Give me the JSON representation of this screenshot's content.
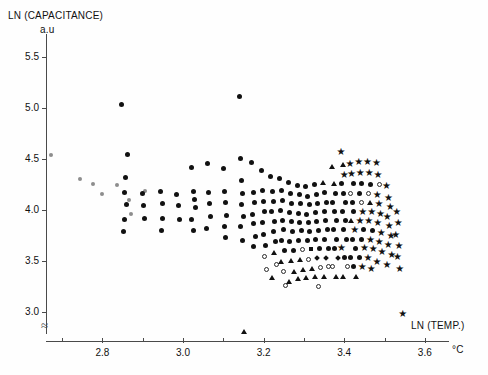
{
  "chart_data": {
    "type": "scatter",
    "title": "",
    "ylabel": "LN (CAPACITANCE)",
    "ylabel_unit": "a.u",
    "xlabel": "LN (TEMP.)",
    "xlabel_unit": "°C",
    "xlim": [
      2.66,
      3.66
    ],
    "ylim": [
      2.72,
      5.72
    ],
    "xticks": [
      2.8,
      3.0,
      3.2,
      3.4,
      3.6
    ],
    "xtick_labels": [
      "2.8",
      "3.0",
      "3.2",
      "3.4",
      "3.6"
    ],
    "xminor_ticks": [
      2.7,
      2.9,
      3.1,
      3.3,
      3.5
    ],
    "yticks": [
      3.0,
      3.5,
      4.0,
      4.5,
      5.0,
      5.5
    ],
    "ytick_labels": [
      "3.0",
      "3.5",
      "4.0",
      "4.5",
      "5.0",
      "5.5"
    ],
    "grid": false,
    "legend": "none",
    "axis_break_y": true,
    "marker_kinds": [
      "circle",
      "open-circle",
      "triangle",
      "star",
      "square",
      "diamond",
      "faint-circle"
    ],
    "n_points": 386,
    "points": [
      [
        2.673,
        4.535,
        "faint"
      ],
      [
        2.745,
        4.3,
        "faint"
      ],
      [
        2.8,
        4.16,
        "faint"
      ],
      [
        2.836,
        4.245,
        "faint"
      ],
      [
        2.866,
        4.095,
        "faint"
      ],
      [
        2.87,
        3.96,
        "faint"
      ],
      [
        2.905,
        4.185,
        "faint"
      ],
      [
        2.776,
        4.255,
        "faint"
      ],
      [
        2.847,
        5.035,
        "circle"
      ],
      [
        2.862,
        4.545,
        "circle"
      ],
      [
        2.858,
        4.32,
        "circle"
      ],
      [
        2.855,
        4.175,
        "circle"
      ],
      [
        2.86,
        4.055,
        "circle"
      ],
      [
        2.856,
        3.905,
        "circle"
      ],
      [
        2.853,
        3.79,
        "circle"
      ],
      [
        2.9,
        4.165,
        "circle"
      ],
      [
        2.902,
        4.04,
        "circle"
      ],
      [
        2.905,
        3.915,
        "circle"
      ],
      [
        2.945,
        4.185,
        "circle"
      ],
      [
        2.948,
        4.06,
        "circle"
      ],
      [
        2.95,
        3.915,
        "circle"
      ],
      [
        2.946,
        3.8,
        "circle"
      ],
      [
        2.985,
        4.15,
        "circle"
      ],
      [
        2.99,
        4.045,
        "circle"
      ],
      [
        2.992,
        3.905,
        "circle"
      ],
      [
        3.02,
        4.42,
        "circle"
      ],
      [
        3.025,
        4.185,
        "circle"
      ],
      [
        3.028,
        4.105,
        "circle"
      ],
      [
        3.03,
        4.025,
        "circle"
      ],
      [
        3.022,
        3.905,
        "circle"
      ],
      [
        3.026,
        3.8,
        "circle"
      ],
      [
        3.06,
        4.455,
        "circle"
      ],
      [
        3.062,
        4.17,
        "circle"
      ],
      [
        3.065,
        4.06,
        "circle"
      ],
      [
        3.068,
        3.935,
        "circle"
      ],
      [
        3.058,
        3.815,
        "circle"
      ],
      [
        3.1,
        4.405,
        "circle"
      ],
      [
        3.104,
        4.18,
        "circle"
      ],
      [
        3.106,
        4.075,
        "circle"
      ],
      [
        3.108,
        3.95,
        "circle"
      ],
      [
        3.102,
        3.835,
        "circle"
      ],
      [
        3.105,
        3.735,
        "circle"
      ],
      [
        3.14,
        5.105,
        "circle"
      ],
      [
        3.142,
        4.5,
        "circle"
      ],
      [
        3.146,
        4.29,
        "circle"
      ],
      [
        3.148,
        4.16,
        "circle"
      ],
      [
        3.144,
        4.055,
        "circle"
      ],
      [
        3.15,
        3.94,
        "circle"
      ],
      [
        3.143,
        3.84,
        "circle"
      ],
      [
        3.147,
        3.7,
        "circle"
      ],
      [
        3.152,
        2.81,
        "triangle"
      ],
      [
        3.17,
        4.46,
        "circle"
      ],
      [
        3.175,
        4.175,
        "circle"
      ],
      [
        3.178,
        4.07,
        "circle"
      ],
      [
        3.172,
        3.96,
        "circle"
      ],
      [
        3.176,
        3.87,
        "circle"
      ],
      [
        3.18,
        3.745,
        "circle"
      ],
      [
        3.174,
        3.64,
        "circle"
      ],
      [
        3.195,
        4.385,
        "circle"
      ],
      [
        3.198,
        4.195,
        "circle"
      ],
      [
        3.2,
        4.08,
        "circle"
      ],
      [
        3.202,
        3.985,
        "circle"
      ],
      [
        3.196,
        3.88,
        "circle"
      ],
      [
        3.199,
        3.76,
        "circle"
      ],
      [
        3.204,
        3.655,
        "circle"
      ],
      [
        3.201,
        3.545,
        "open"
      ],
      [
        3.206,
        3.42,
        "open"
      ],
      [
        3.218,
        4.33,
        "circle"
      ],
      [
        3.222,
        4.18,
        "circle"
      ],
      [
        3.225,
        4.085,
        "circle"
      ],
      [
        3.22,
        3.99,
        "circle"
      ],
      [
        3.228,
        3.89,
        "circle"
      ],
      [
        3.224,
        3.79,
        "circle"
      ],
      [
        3.23,
        3.69,
        "circle"
      ],
      [
        3.226,
        3.58,
        "triangle"
      ],
      [
        3.232,
        3.47,
        "open"
      ],
      [
        3.221,
        3.345,
        "triangle"
      ],
      [
        3.24,
        4.31,
        "circle"
      ],
      [
        3.244,
        4.195,
        "circle"
      ],
      [
        3.248,
        4.09,
        "circle"
      ],
      [
        3.242,
        3.995,
        "circle"
      ],
      [
        3.246,
        3.9,
        "circle"
      ],
      [
        3.25,
        3.805,
        "circle"
      ],
      [
        3.245,
        3.705,
        "circle"
      ],
      [
        3.252,
        3.6,
        "circle"
      ],
      [
        3.243,
        3.5,
        "triangle"
      ],
      [
        3.249,
        3.395,
        "open"
      ],
      [
        3.254,
        3.265,
        "open"
      ],
      [
        3.262,
        4.265,
        "circle"
      ],
      [
        3.266,
        4.16,
        "circle"
      ],
      [
        3.27,
        4.065,
        "circle"
      ],
      [
        3.264,
        3.975,
        "circle"
      ],
      [
        3.268,
        3.885,
        "circle"
      ],
      [
        3.272,
        3.79,
        "circle"
      ],
      [
        3.265,
        3.695,
        "circle"
      ],
      [
        3.274,
        3.605,
        "circle"
      ],
      [
        3.269,
        3.505,
        "triangle"
      ],
      [
        3.276,
        3.4,
        "triangle"
      ],
      [
        3.263,
        3.3,
        "triangle"
      ],
      [
        3.284,
        4.24,
        "circle"
      ],
      [
        3.288,
        4.15,
        "circle"
      ],
      [
        3.292,
        4.06,
        "circle"
      ],
      [
        3.286,
        3.97,
        "circle"
      ],
      [
        3.29,
        3.88,
        "circle"
      ],
      [
        3.294,
        3.795,
        "circle"
      ],
      [
        3.287,
        3.7,
        "circle"
      ],
      [
        3.296,
        3.61,
        "open"
      ],
      [
        3.291,
        3.515,
        "triangle"
      ],
      [
        3.298,
        3.42,
        "triangle"
      ],
      [
        3.285,
        3.33,
        "triangle"
      ],
      [
        3.305,
        4.225,
        "circle"
      ],
      [
        3.309,
        4.135,
        "circle"
      ],
      [
        3.313,
        4.05,
        "circle"
      ],
      [
        3.307,
        3.96,
        "circle"
      ],
      [
        3.311,
        3.875,
        "circle"
      ],
      [
        3.315,
        3.79,
        "circle"
      ],
      [
        3.308,
        3.7,
        "circle"
      ],
      [
        3.317,
        3.615,
        "square"
      ],
      [
        3.312,
        3.52,
        "open"
      ],
      [
        3.319,
        3.43,
        "triangle"
      ],
      [
        3.306,
        3.34,
        "triangle"
      ],
      [
        3.326,
        4.245,
        "circle"
      ],
      [
        3.33,
        4.15,
        "circle"
      ],
      [
        3.334,
        4.06,
        "circle"
      ],
      [
        3.328,
        3.975,
        "circle"
      ],
      [
        3.332,
        3.885,
        "circle"
      ],
      [
        3.336,
        3.8,
        "circle"
      ],
      [
        3.329,
        3.71,
        "circle"
      ],
      [
        3.338,
        3.62,
        "circle"
      ],
      [
        3.333,
        3.53,
        "diamond"
      ],
      [
        3.34,
        3.44,
        "open"
      ],
      [
        3.327,
        3.35,
        "triangle"
      ],
      [
        3.335,
        3.255,
        "open"
      ],
      [
        3.348,
        4.27,
        "triangle"
      ],
      [
        3.352,
        4.17,
        "circle"
      ],
      [
        3.356,
        4.075,
        "circle"
      ],
      [
        3.35,
        3.985,
        "circle"
      ],
      [
        3.354,
        3.895,
        "circle"
      ],
      [
        3.358,
        3.805,
        "circle"
      ],
      [
        3.351,
        3.715,
        "circle"
      ],
      [
        3.36,
        3.625,
        "circle"
      ],
      [
        3.355,
        3.535,
        "diamond"
      ],
      [
        3.362,
        3.445,
        "open"
      ],
      [
        3.349,
        3.355,
        "triangle"
      ],
      [
        3.37,
        4.43,
        "triangle"
      ],
      [
        3.374,
        4.26,
        "triangle"
      ],
      [
        3.378,
        4.165,
        "circle"
      ],
      [
        3.372,
        4.075,
        "circle"
      ],
      [
        3.376,
        3.985,
        "circle"
      ],
      [
        3.38,
        3.895,
        "circle"
      ],
      [
        3.373,
        3.805,
        "circle"
      ],
      [
        3.382,
        3.715,
        "circle"
      ],
      [
        3.377,
        3.625,
        "circle"
      ],
      [
        3.384,
        3.535,
        "diamond"
      ],
      [
        3.371,
        3.445,
        "open"
      ],
      [
        3.379,
        3.355,
        "triangle"
      ],
      [
        3.392,
        4.57,
        "star"
      ],
      [
        3.396,
        4.445,
        "triangle"
      ],
      [
        3.4,
        4.345,
        "star"
      ],
      [
        3.394,
        4.255,
        "circle"
      ],
      [
        3.398,
        4.165,
        "circle"
      ],
      [
        3.402,
        4.075,
        "circle"
      ],
      [
        3.395,
        3.985,
        "circle"
      ],
      [
        3.404,
        3.895,
        "circle"
      ],
      [
        3.399,
        3.805,
        "circle"
      ],
      [
        3.406,
        3.715,
        "circle"
      ],
      [
        3.393,
        3.625,
        "star"
      ],
      [
        3.401,
        3.535,
        "circle"
      ],
      [
        3.408,
        3.445,
        "open"
      ],
      [
        3.397,
        3.355,
        "triangle"
      ],
      [
        3.414,
        4.445,
        "star"
      ],
      [
        3.418,
        4.35,
        "star"
      ],
      [
        3.422,
        4.255,
        "circle"
      ],
      [
        3.416,
        4.165,
        "open"
      ],
      [
        3.42,
        4.075,
        "circle"
      ],
      [
        3.424,
        3.985,
        "circle"
      ],
      [
        3.417,
        3.895,
        "triangle"
      ],
      [
        3.426,
        3.805,
        "star"
      ],
      [
        3.421,
        3.715,
        "circle"
      ],
      [
        3.428,
        3.625,
        "circle"
      ],
      [
        3.415,
        3.535,
        "circle"
      ],
      [
        3.423,
        3.445,
        "circle"
      ],
      [
        3.429,
        3.355,
        "triangle"
      ],
      [
        3.436,
        4.47,
        "star"
      ],
      [
        3.44,
        4.36,
        "star"
      ],
      [
        3.444,
        4.255,
        "circle"
      ],
      [
        3.438,
        4.165,
        "circle"
      ],
      [
        3.442,
        4.075,
        "open"
      ],
      [
        3.446,
        3.985,
        "star"
      ],
      [
        3.439,
        3.895,
        "star"
      ],
      [
        3.448,
        3.805,
        "circle"
      ],
      [
        3.443,
        3.715,
        "circle"
      ],
      [
        3.45,
        3.625,
        "star"
      ],
      [
        3.437,
        3.535,
        "circle"
      ],
      [
        3.445,
        3.445,
        "star"
      ],
      [
        3.458,
        4.47,
        "star"
      ],
      [
        3.462,
        4.36,
        "star"
      ],
      [
        3.466,
        4.25,
        "circle"
      ],
      [
        3.46,
        4.16,
        "open"
      ],
      [
        3.464,
        4.07,
        "triangle"
      ],
      [
        3.468,
        3.98,
        "star"
      ],
      [
        3.461,
        3.89,
        "star"
      ],
      [
        3.47,
        3.8,
        "circle"
      ],
      [
        3.465,
        3.71,
        "star"
      ],
      [
        3.472,
        3.62,
        "star"
      ],
      [
        3.459,
        3.53,
        "star"
      ],
      [
        3.467,
        3.42,
        "star"
      ],
      [
        3.48,
        4.455,
        "star"
      ],
      [
        3.484,
        4.345,
        "star"
      ],
      [
        3.488,
        4.25,
        "open"
      ],
      [
        3.482,
        4.15,
        "star"
      ],
      [
        3.486,
        4.055,
        "star"
      ],
      [
        3.49,
        3.965,
        "star"
      ],
      [
        3.483,
        3.87,
        "star"
      ],
      [
        3.492,
        3.775,
        "star"
      ],
      [
        3.487,
        3.685,
        "star"
      ],
      [
        3.494,
        3.59,
        "star"
      ],
      [
        3.481,
        3.49,
        "star"
      ],
      [
        3.505,
        4.23,
        "star"
      ],
      [
        3.51,
        4.12,
        "star"
      ],
      [
        3.514,
        4.03,
        "star"
      ],
      [
        3.507,
        3.93,
        "star"
      ],
      [
        3.512,
        3.84,
        "star"
      ],
      [
        3.516,
        3.745,
        "star"
      ],
      [
        3.509,
        3.655,
        "star"
      ],
      [
        3.518,
        3.56,
        "star"
      ],
      [
        3.506,
        3.465,
        "star"
      ],
      [
        3.53,
        3.985,
        "star"
      ],
      [
        3.534,
        3.87,
        "star"
      ],
      [
        3.528,
        3.76,
        "star"
      ],
      [
        3.536,
        3.65,
        "star"
      ],
      [
        3.532,
        3.54,
        "star"
      ],
      [
        3.538,
        3.42,
        "star"
      ],
      [
        3.545,
        2.985,
        "star"
      ]
    ]
  }
}
